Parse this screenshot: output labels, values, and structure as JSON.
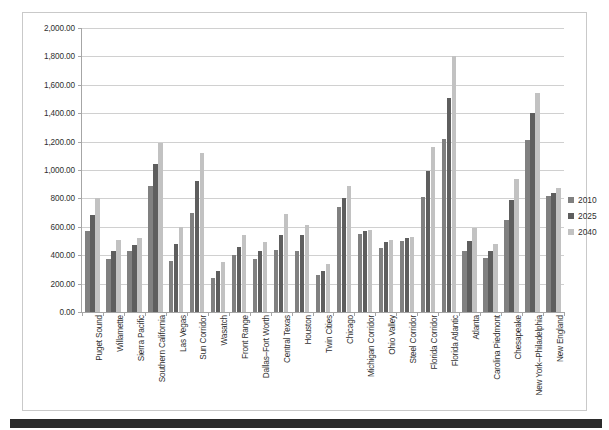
{
  "chart_data": {
    "type": "bar",
    "title": "",
    "xlabel": "",
    "ylabel": "",
    "ylim": [
      0,
      2000
    ],
    "ytick_step": 200,
    "grid": true,
    "legend_position": "right",
    "ytick_labels": [
      "0.00",
      "200.00",
      "400.00",
      "600.00",
      "800.00",
      "1,000.00",
      "1,200.00",
      "1,400.00",
      "1,600.00",
      "1,800.00",
      "2,000.00"
    ],
    "categories": [
      "Puget Sound",
      "Willamette",
      "Sierra Pacific",
      "Southern California",
      "Las Vegas",
      "Sun Corridor",
      "Wasatch",
      "Front Range",
      "Dallas–Fort Worth",
      "Central Texas",
      "Houston",
      "Twin Cities",
      "Chicago",
      "Michigan Corridor",
      "Ohio Valley",
      "Steel Corridor",
      "Florida Corridor",
      "Florida Atlantic",
      "Atlanta",
      "Carolina Piedmont",
      "Chesapeake",
      "New York–Philadelphia",
      "New England"
    ],
    "series": [
      {
        "name": "2010",
        "color": "#808080",
        "values": [
          570,
          370,
          430,
          890,
          360,
          700,
          240,
          400,
          370,
          440,
          430,
          260,
          740,
          550,
          450,
          500,
          810,
          1220,
          430,
          380,
          650,
          1210,
          820
        ]
      },
      {
        "name": "2025",
        "color": "#5e5e5e",
        "values": [
          680,
          430,
          470,
          1040,
          480,
          920,
          290,
          460,
          430,
          540,
          540,
          290,
          800,
          570,
          490,
          520,
          990,
          1510,
          500,
          430,
          790,
          1400,
          840
        ]
      },
      {
        "name": "2040",
        "color": "#c2c2c2",
        "values": [
          800,
          510,
          520,
          1190,
          600,
          1120,
          350,
          540,
          490,
          690,
          610,
          340,
          890,
          580,
          510,
          530,
          1160,
          1800,
          590,
          480,
          940,
          1540,
          870
        ]
      }
    ]
  },
  "legend": {
    "entries": [
      {
        "label": "2010"
      },
      {
        "label": "2025"
      },
      {
        "label": "2040"
      }
    ]
  }
}
